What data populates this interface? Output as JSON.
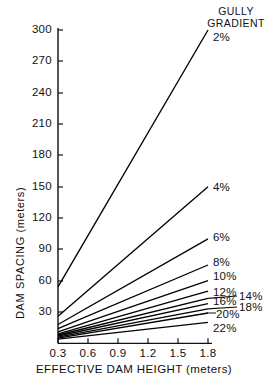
{
  "chart_data": {
    "type": "line",
    "title": "",
    "xlabel": "EFFECTIVE  DAM  HEIGHT (meters)",
    "ylabel": "DAM  SPACING (meters)",
    "legend_title_line1": "GULLY",
    "legend_title_line2": "GRADIENT",
    "legend_position": "right-of-line-ends",
    "grid": false,
    "xlim": [
      0.3,
      1.8
    ],
    "ylim": [
      0,
      300
    ],
    "xticks": [
      0.3,
      0.6,
      0.9,
      1.2,
      1.5,
      1.8
    ],
    "xtick_labels": [
      "0.3",
      "0.6",
      "0.9",
      "1.2",
      "1.5",
      "1.8"
    ],
    "yticks": [
      30,
      60,
      90,
      120,
      150,
      180,
      210,
      240,
      270,
      300
    ],
    "ytick_labels": [
      "30",
      "60",
      "90",
      "120",
      "150",
      "180",
      "210",
      "240",
      "270",
      "300"
    ],
    "x": [
      0.3,
      1.8
    ],
    "series": [
      {
        "name": "2%",
        "label": "2%",
        "values": [
          54,
          300
        ]
      },
      {
        "name": "4%",
        "label": "4%",
        "values": [
          26,
          150
        ]
      },
      {
        "name": "6%",
        "label": "6%",
        "values": [
          18,
          100
        ]
      },
      {
        "name": "8%",
        "label": "8%",
        "values": [
          14,
          75
        ]
      },
      {
        "name": "10%",
        "label": "10%",
        "values": [
          11,
          60
        ]
      },
      {
        "name": "12%",
        "label": "12%",
        "values": [
          9,
          50
        ]
      },
      {
        "name": "14%",
        "label": "14%",
        "values": [
          8,
          43
        ]
      },
      {
        "name": "16%",
        "label": "16%",
        "values": [
          7,
          38
        ]
      },
      {
        "name": "18%",
        "label": "18%",
        "values": [
          6,
          33
        ]
      },
      {
        "name": "20%",
        "label": "20%",
        "values": [
          5,
          29
        ]
      },
      {
        "name": "22%",
        "label": "22%",
        "values": [
          4,
          20
        ]
      }
    ]
  },
  "axis": {
    "y_ticks": [
      {
        "label": "300",
        "y": 30
      },
      {
        "label": "270",
        "y": 61
      },
      {
        "label": "240",
        "y": 93
      },
      {
        "label": "210",
        "y": 124
      },
      {
        "label": "180",
        "y": 155
      },
      {
        "label": "150",
        "y": 187
      },
      {
        "label": "120",
        "y": 218
      },
      {
        "label": "90",
        "y": 249
      },
      {
        "label": "60",
        "y": 281
      },
      {
        "label": "30",
        "y": 312
      }
    ],
    "x_ticks": [
      {
        "label": "0.3",
        "x": 58
      },
      {
        "label": "0.6",
        "x": 88
      },
      {
        "label": "0.9",
        "x": 118
      },
      {
        "label": "1.2",
        "x": 148
      },
      {
        "label": "1.5",
        "x": 178
      },
      {
        "label": "1.8",
        "x": 208
      }
    ]
  },
  "series_labels": [
    {
      "text": "2%",
      "left": 213,
      "top": 31,
      "leader": null
    },
    {
      "text": "4%",
      "left": 213,
      "top": 181,
      "leader": null
    },
    {
      "text": "6%",
      "left": 213,
      "top": 231,
      "leader": null
    },
    {
      "text": "8%",
      "left": 213,
      "top": 256,
      "leader": null
    },
    {
      "text": "10%",
      "left": 213,
      "top": 270,
      "leader": null
    },
    {
      "text": "12%",
      "left": 213,
      "top": 286,
      "leader": null
    },
    {
      "text": "16%",
      "left": 213,
      "top": 295,
      "leader": null
    },
    {
      "text": "14%",
      "left": 239,
      "top": 290,
      "leader": "to-16-row"
    },
    {
      "text": "18%",
      "left": 239,
      "top": 301,
      "leader": "to-18-row"
    },
    {
      "text": "20%",
      "left": 216,
      "top": 308,
      "leader": "short-hook"
    },
    {
      "text": "22%",
      "left": 213,
      "top": 322,
      "leader": null
    }
  ],
  "colors": {
    "axis": "#111111",
    "line": "#000000",
    "text": "#111111",
    "background": "#ffffff"
  }
}
